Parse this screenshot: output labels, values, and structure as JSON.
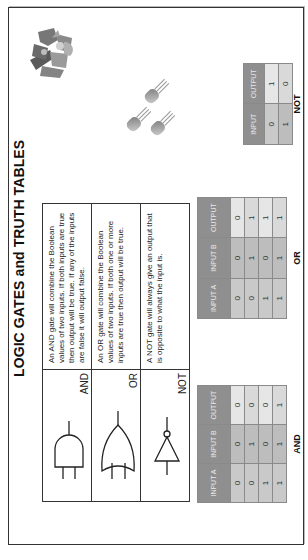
{
  "title": "LOGIC GATES and TRUTH TABLES",
  "gates": [
    {
      "name": "AND",
      "icon": "and-gate-icon",
      "description": "An AND gate will combine the Boolean values of two inputs. If both inputs are true then output will be true. If any of the inputs are false it will output false."
    },
    {
      "name": "OR",
      "icon": "or-gate-icon",
      "description": "An OR gate will combine the Boolean values of two inputs. If both one or more inputs are true then output will be true."
    },
    {
      "name": "NOT",
      "icon": "not-gate-icon",
      "description": "A NOT gate will always give an output that is opposite to what the input is."
    }
  ],
  "truth_tables": {
    "and": {
      "caption": "AND",
      "headers": [
        "INPUT A",
        "INPUT B",
        "OUTPUT"
      ],
      "rows": [
        [
          "0",
          "0",
          "0"
        ],
        [
          "0",
          "1",
          "0"
        ],
        [
          "1",
          "0",
          "0"
        ],
        [
          "1",
          "1",
          "1"
        ]
      ]
    },
    "or": {
      "caption": "OR",
      "headers": [
        "INPUT A",
        "INPUT B",
        "OUTPUT"
      ],
      "rows": [
        [
          "0",
          "0",
          "0"
        ],
        [
          "0",
          "1",
          "1"
        ],
        [
          "1",
          "0",
          "1"
        ],
        [
          "1",
          "1",
          "1"
        ]
      ]
    },
    "not": {
      "caption": "NOT",
      "headers": [
        "INPUT",
        "OUTPUT"
      ],
      "rows": [
        [
          "0",
          "1"
        ],
        [
          "1",
          "0"
        ]
      ]
    }
  },
  "illustrations": [
    "transistors-icon",
    "puzzle-pieces-icon"
  ]
}
